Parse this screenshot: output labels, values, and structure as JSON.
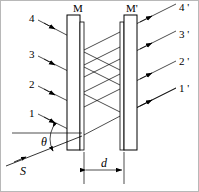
{
  "figure": {
    "type": "optics-ray-diagram",
    "width": 199,
    "height": 192,
    "stroke_color": "#000000",
    "background_color": "#ffffff"
  },
  "mirrors": {
    "left": {
      "label": "M",
      "label_x": 73,
      "label_y": 3
    },
    "right": {
      "label": "M'",
      "label_x": 126,
      "label_y": 3
    }
  },
  "incident_rays": [
    {
      "label": "4",
      "x": 29,
      "y": 18
    },
    {
      "label": "3",
      "x": 29,
      "y": 54
    },
    {
      "label": "2",
      "x": 29,
      "y": 84
    },
    {
      "label": "1",
      "x": 29,
      "y": 113
    }
  ],
  "emergent_rays": [
    {
      "label": "4 '",
      "x": 179,
      "y": 13
    },
    {
      "label": "3 '",
      "x": 179,
      "y": 45
    },
    {
      "label": "2 '",
      "x": 179,
      "y": 75
    },
    {
      "label": "1 '",
      "x": 179,
      "y": 105
    }
  ],
  "annotations": {
    "angle": {
      "label": "θ",
      "x": 41,
      "y": 142
    },
    "source": {
      "label": "S",
      "x": 20,
      "y": 168
    },
    "separation": {
      "label": "d",
      "x": 101,
      "y": 160
    }
  }
}
